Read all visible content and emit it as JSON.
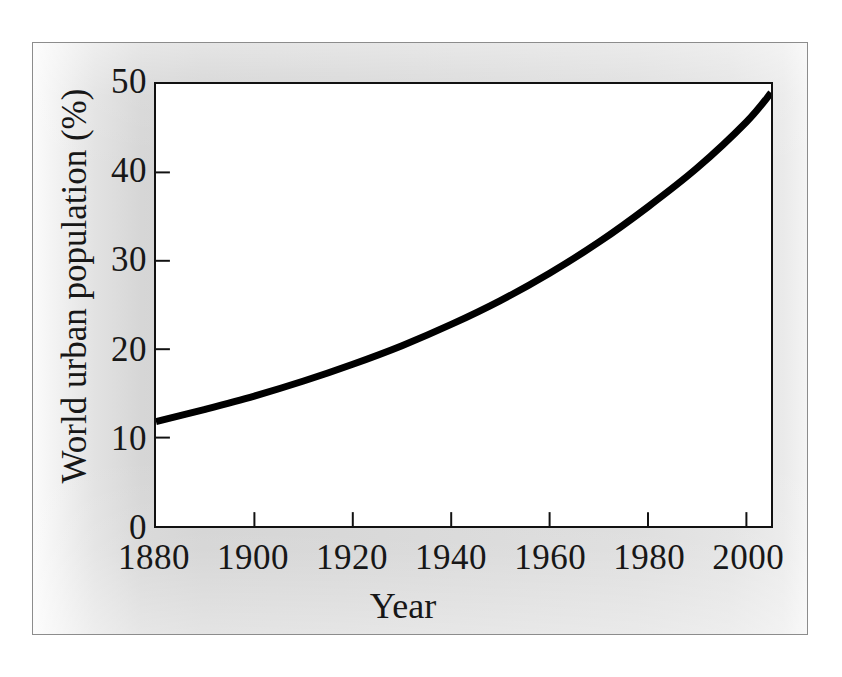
{
  "figure": {
    "background_color": "#d6d6d6",
    "frame_border_color": "#8c8c8c",
    "plot_background_color": "#ffffff",
    "axis_color": "#111111",
    "curve_color": "#000000"
  },
  "chart_data": {
    "type": "line",
    "title": "",
    "subtitle": "",
    "xlabel": "Year",
    "ylabel": "World urban population (%)",
    "xlim": [
      1880,
      2005
    ],
    "ylim": [
      0,
      50
    ],
    "xticks": [
      1880,
      1900,
      1920,
      1940,
      1960,
      1980,
      2000
    ],
    "xtick_labels": [
      "1880",
      "1900",
      "1920",
      "1940",
      "1960",
      "1980",
      "2000"
    ],
    "yticks": [
      0,
      10,
      20,
      30,
      40,
      50
    ],
    "ytick_labels": [
      "0",
      "10",
      "20",
      "30",
      "40",
      "50"
    ],
    "grid": false,
    "legend": null,
    "tick_direction": "in",
    "series": [
      {
        "name": "World urban population",
        "x": [
          1880,
          1890,
          1900,
          1910,
          1920,
          1930,
          1940,
          1950,
          1960,
          1970,
          1980,
          1990,
          2000,
          2005
        ],
        "values": [
          11.8,
          13.2,
          14.7,
          16.4,
          18.3,
          20.4,
          22.8,
          25.5,
          28.6,
          32.1,
          36.1,
          40.5,
          45.7,
          49.0
        ]
      }
    ],
    "annotations": []
  }
}
